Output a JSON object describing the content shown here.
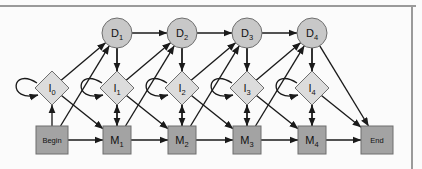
{
  "figure": {
    "kind": "profile-hmm-state-diagram",
    "background_color": "#fbfbfb",
    "frame_line_color": "#9a9a9a",
    "edge_color": "#1a1a1a",
    "node_stroke_color": "#6e6e6e"
  },
  "palette": {
    "delete_fill": "#c8c8c8",
    "insert_fill": "#dcdcdc",
    "match_fill": "#a3a3a3",
    "terminal_fill": "#a3a3a3"
  },
  "geometry": {
    "delete_row_y": 33,
    "insert_row_y": 88,
    "match_row_y": 140,
    "column_spacing": 65,
    "delete_radius": 15,
    "insert_half_width": 17,
    "insert_half_height": 17,
    "match_half_size": 14
  },
  "nodes": {
    "delete_states": [
      {
        "id": "D1",
        "base": "D",
        "sub": "1",
        "cx": 117,
        "cy": 33
      },
      {
        "id": "D2",
        "base": "D",
        "sub": "2",
        "cx": 182,
        "cy": 33
      },
      {
        "id": "D3",
        "base": "D",
        "sub": "3",
        "cx": 247,
        "cy": 33
      },
      {
        "id": "D4",
        "base": "D",
        "sub": "4",
        "cx": 312,
        "cy": 33
      }
    ],
    "insert_states": [
      {
        "id": "I0",
        "base": "I",
        "sub": "0",
        "cx": 52,
        "cy": 88
      },
      {
        "id": "I1",
        "base": "I",
        "sub": "1",
        "cx": 117,
        "cy": 88
      },
      {
        "id": "I2",
        "base": "I",
        "sub": "2",
        "cx": 182,
        "cy": 88
      },
      {
        "id": "I3",
        "base": "I",
        "sub": "3",
        "cx": 247,
        "cy": 88
      },
      {
        "id": "I4",
        "base": "I",
        "sub": "4",
        "cx": 312,
        "cy": 88
      }
    ],
    "match_states": [
      {
        "id": "M1",
        "base": "M",
        "sub": "1",
        "cx": 117,
        "cy": 140
      },
      {
        "id": "M2",
        "base": "M",
        "sub": "2",
        "cx": 182,
        "cy": 140
      },
      {
        "id": "M3",
        "base": "M",
        "sub": "3",
        "cx": 247,
        "cy": 140
      },
      {
        "id": "M4",
        "base": "M",
        "sub": "4",
        "cx": 312,
        "cy": 140
      }
    ],
    "terminals": [
      {
        "id": "Begin",
        "label": "Begin",
        "cx": 52,
        "cy": 140
      },
      {
        "id": "End",
        "label": "End",
        "cx": 377,
        "cy": 140
      }
    ]
  },
  "chart_data": {
    "type": "diagram",
    "title": "",
    "node_labels": [
      "D1",
      "D2",
      "D3",
      "D4",
      "I0",
      "I1",
      "I2",
      "I3",
      "I4",
      "Begin",
      "M1",
      "M2",
      "M3",
      "M4",
      "End"
    ],
    "edges": [
      [
        "Begin",
        "M1"
      ],
      [
        "M1",
        "M2"
      ],
      [
        "M2",
        "M3"
      ],
      [
        "M3",
        "M4"
      ],
      [
        "M4",
        "End"
      ],
      [
        "Begin",
        "I0"
      ],
      [
        "M1",
        "I1"
      ],
      [
        "M2",
        "I2"
      ],
      [
        "M3",
        "I3"
      ],
      [
        "M4",
        "I4"
      ],
      [
        "I0",
        "I0"
      ],
      [
        "I1",
        "I1"
      ],
      [
        "I2",
        "I2"
      ],
      [
        "I3",
        "I3"
      ],
      [
        "I4",
        "I4"
      ],
      [
        "I0",
        "M1"
      ],
      [
        "I1",
        "M2"
      ],
      [
        "I2",
        "M3"
      ],
      [
        "I3",
        "M4"
      ],
      [
        "I4",
        "End"
      ],
      [
        "Begin",
        "D1"
      ],
      [
        "M1",
        "D2"
      ],
      [
        "M2",
        "D3"
      ],
      [
        "M3",
        "D4"
      ],
      [
        "D1",
        "D2"
      ],
      [
        "D2",
        "D3"
      ],
      [
        "D3",
        "D4"
      ],
      [
        "D1",
        "M1"
      ],
      [
        "D2",
        "M2"
      ],
      [
        "D3",
        "M3"
      ],
      [
        "D4",
        "M4"
      ],
      [
        "D4",
        "End"
      ],
      [
        "D1",
        "I1"
      ],
      [
        "D2",
        "I2"
      ],
      [
        "D3",
        "I3"
      ],
      [
        "D4",
        "I4"
      ],
      [
        "I0",
        "D1"
      ],
      [
        "I1",
        "D2"
      ],
      [
        "I2",
        "D3"
      ],
      [
        "I3",
        "D4"
      ]
    ]
  }
}
